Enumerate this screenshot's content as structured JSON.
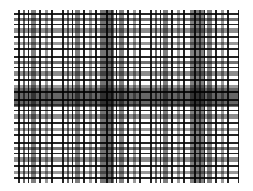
{
  "image": {
    "description": "Grayscale plaid tartan fabric texture",
    "palette": [
      "#000000",
      "#3a3a3a",
      "#808080",
      "#ffffff"
    ]
  }
}
